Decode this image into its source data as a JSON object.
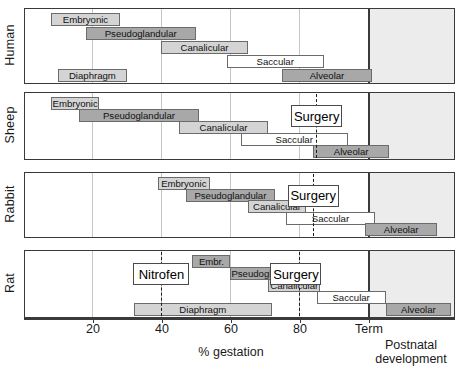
{
  "chart_data": {
    "type": "bar",
    "title": "",
    "xlabel": "% gestation",
    "ylabel": "",
    "xlim": [
      0,
      120
    ],
    "xticks": [
      20,
      40,
      60,
      80,
      100
    ],
    "xticklabels": [
      "20",
      "40",
      "60",
      "80",
      "Term"
    ],
    "grid": true,
    "legend": "none",
    "annotations": {
      "postnatal_label_line1": "Postnatal",
      "postnatal_label_line2": "development",
      "term_percent": 100,
      "note": "Horizontal timeline (Gantt-style) of lung developmental stages expressed as % gestation for four species, with fetal intervention timings marked by dashed lines."
    },
    "rows": [
      {
        "species": "Human",
        "bars": [
          {
            "label": "Embryonic",
            "start": 8,
            "end": 28,
            "shade": "light",
            "track": 0
          },
          {
            "label": "Pseudoglandular",
            "start": 18,
            "end": 50,
            "shade": "mid",
            "track": 1
          },
          {
            "label": "Canalicular",
            "start": 40,
            "end": 65,
            "shade": "light",
            "track": 2
          },
          {
            "label": "Saccular",
            "start": 59,
            "end": 87,
            "shade": "white",
            "track": 3
          },
          {
            "label": "Alveolar",
            "start": 75,
            "end": 101,
            "shade": "mid",
            "track": 4
          },
          {
            "label": "Diaphragm",
            "start": 10,
            "end": 30,
            "shade": "light",
            "track": 4
          }
        ],
        "markers": [],
        "callouts": []
      },
      {
        "species": "Sheep",
        "bars": [
          {
            "label": "Embryonic",
            "start": 8,
            "end": 22,
            "shade": "light",
            "track": 0
          },
          {
            "label": "Pseudoglandular",
            "start": 16,
            "end": 51,
            "shade": "mid",
            "track": 1
          },
          {
            "label": "Canalicular",
            "start": 45,
            "end": 71,
            "shade": "light",
            "track": 2
          },
          {
            "label": "Saccular",
            "start": 63,
            "end": 94,
            "shade": "white",
            "track": 3
          },
          {
            "label": "Alveolar",
            "start": 84,
            "end": 106,
            "shade": "mid",
            "track": 4
          }
        ],
        "markers": [
          {
            "label": "Surgery",
            "percent": 85
          }
        ],
        "callouts": [
          {
            "label": "Surgery",
            "percent": 85
          }
        ]
      },
      {
        "species": "Rabbit",
        "bars": [
          {
            "label": "Embryonic",
            "start": 39,
            "end": 54,
            "shade": "light",
            "track": 0
          },
          {
            "label": "Pseudoglandular",
            "start": 47,
            "end": 73,
            "shade": "mid",
            "track": 1
          },
          {
            "label": "Canalicular",
            "start": 65,
            "end": 82,
            "shade": "light",
            "track": 2
          },
          {
            "label": "Saccular",
            "start": 76,
            "end": 102,
            "shade": "white",
            "track": 3
          },
          {
            "label": "Alveolar",
            "start": 99,
            "end": 120,
            "shade": "mid",
            "track": 4
          }
        ],
        "markers": [
          {
            "label": "Surgery",
            "percent": 84
          }
        ],
        "callouts": [
          {
            "label": "Surgery",
            "percent": 84
          }
        ]
      },
      {
        "species": "Rat",
        "bars": [
          {
            "label": "Embr.",
            "start": 49,
            "end": 60,
            "shade": "mid",
            "track": 0
          },
          {
            "label": "Pseudogl.",
            "start": 60,
            "end": 72,
            "shade": "mid",
            "track": 1
          },
          {
            "label": "Canalicular",
            "start": 71,
            "end": 86,
            "shade": "light",
            "track": 2
          },
          {
            "label": "Saccular",
            "start": 85,
            "end": 105,
            "shade": "white",
            "track": 3
          },
          {
            "label": "Alveolar",
            "start": 105,
            "end": 124,
            "shade": "mid",
            "track": 4
          },
          {
            "label": "Diaphragm",
            "start": 32,
            "end": 72,
            "shade": "light",
            "track": 4
          }
        ],
        "markers": [
          {
            "label": "Nitrofen",
            "percent": 40
          },
          {
            "label": "Surgery",
            "percent": 80
          }
        ],
        "callouts": [
          {
            "label": "Nitrofen",
            "percent": 40
          },
          {
            "label": "Surgery",
            "percent": 79
          }
        ]
      }
    ]
  },
  "colors": {
    "bar_light": "#d4d4d4",
    "bar_mid": "#a8a8a8",
    "bar_white": "#ffffff",
    "bar_border": "#6b6b6b",
    "panel_border": "#3a3a3a",
    "postnatal_shade": "#ececed",
    "gridline": "#c6c6c6",
    "marker_line": "#1a1a1a"
  }
}
